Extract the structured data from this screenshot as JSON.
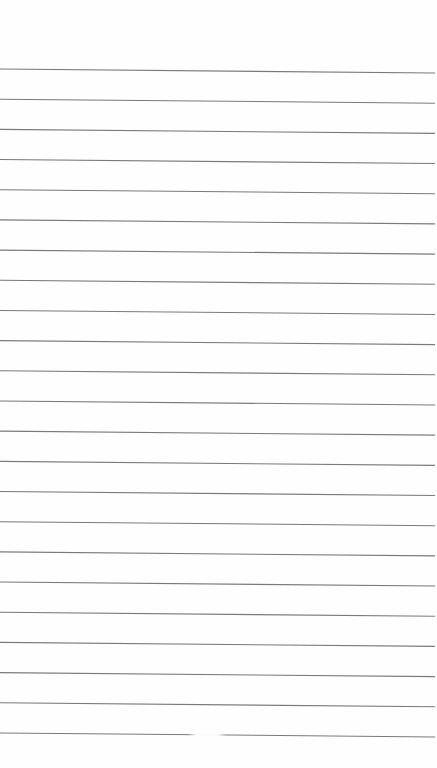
{
  "page": {
    "type": "ruled-paper",
    "background_color": "#fefefe",
    "rule_color": "#7a7a7a",
    "rule_count": 23,
    "first_rule_y_left": 69,
    "first_rule_y_right": 73,
    "rule_spacing": 30.18,
    "rule_start_x": 0,
    "rule_end_x": 435,
    "faded_segment": {
      "rule_index": 22,
      "from_x": 188,
      "to_x": 226
    }
  }
}
